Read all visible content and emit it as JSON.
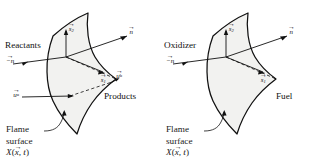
{
  "figure": {
    "type": "scientific-diagram",
    "background_color": "#ffffff",
    "line_color": "#111111",
    "surface_fill": "#f2f2f0"
  },
  "panels": [
    {
      "id": "premixed",
      "labels": {
        "upstream_region": "Reactants",
        "downstream_region": "Products",
        "caption_line1": "Flame",
        "caption_line2": "surface",
        "caption_formula_name": "X",
        "caption_formula_arg": "x",
        "caption_formula_time": ", t"
      },
      "vectors": [
        {
          "name": "normal-outward",
          "base": "n",
          "arrow": "→",
          "sub": "",
          "sup": ""
        },
        {
          "name": "normal-inward",
          "base": "−n",
          "arrow": "→",
          "sub": "",
          "sup": ""
        },
        {
          "name": "tangent-2",
          "base": "s",
          "arrow": "→",
          "sub": "2",
          "sup": ""
        },
        {
          "name": "tangent-1",
          "base": "s",
          "arrow": "→",
          "sub": "1",
          "sup": ""
        },
        {
          "name": "velocity-unburned",
          "base": "u",
          "arrow": "→",
          "sub": "",
          "sup": "u"
        },
        {
          "name": "velocity-burned",
          "base": "u",
          "arrow": "→",
          "sub": "",
          "sup": "b"
        }
      ]
    },
    {
      "id": "non-premixed",
      "labels": {
        "upstream_region": "Oxidizer",
        "downstream_region": "Fuel",
        "caption_line1": "Flame",
        "caption_line2": "surface",
        "caption_formula_name": "X",
        "caption_formula_arg": "x",
        "caption_formula_time": ", t"
      },
      "vectors": [
        {
          "name": "normal-outward",
          "base": "n",
          "arrow": "→",
          "sub": "",
          "sup": ""
        },
        {
          "name": "normal-inward",
          "base": "−n",
          "arrow": "→",
          "sub": "",
          "sup": ""
        },
        {
          "name": "tangent-2",
          "base": "s",
          "arrow": "→",
          "sub": "2",
          "sup": ""
        },
        {
          "name": "tangent-1",
          "base": "s",
          "arrow": "→",
          "sub": "1",
          "sup": ""
        }
      ]
    }
  ]
}
